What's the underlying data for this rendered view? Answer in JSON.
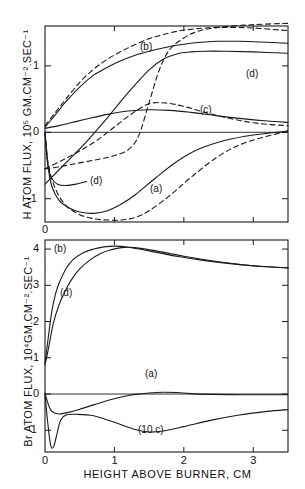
{
  "figure": {
    "panels": [
      {
        "id": "upper",
        "ylabel": "H ATOM FLUX, 10⁵ GM.CM⁻².SEC⁻¹",
        "yticks": [
          "1",
          "0",
          "-1"
        ],
        "xticks": [
          "0",
          "1",
          "2",
          "3"
        ],
        "curve_labels": [
          {
            "text": "(b)",
            "x": 140,
            "y": 41
          },
          {
            "text": "(d)",
            "x": 246,
            "y": 68
          },
          {
            "text": "(c)",
            "x": 200,
            "y": 104
          },
          {
            "text": "(d)",
            "x": 90,
            "y": 175
          },
          {
            "text": "(a)",
            "x": 150,
            "y": 183
          }
        ]
      },
      {
        "id": "lower",
        "ylabel": "Br ATOM FLUX, 10⁴GM.CM⁻².SEC⁻¹",
        "yticks": [
          "4",
          "3",
          "2",
          "1",
          "0",
          "-1"
        ],
        "xticks": [
          "0",
          "1",
          "2",
          "3"
        ],
        "curve_labels": [
          {
            "text": "(b)",
            "x": 54,
            "y": 243
          },
          {
            "text": "(d)",
            "x": 60,
            "y": 287
          },
          {
            "text": "(a)",
            "x": 145,
            "y": 368
          },
          {
            "text": "(10 c)",
            "x": 138,
            "y": 424
          }
        ]
      }
    ],
    "xlabel": "HEIGHT ABOVE BURNER, CM"
  },
  "chart_data": {
    "type": "line",
    "title": "",
    "xlabel": "HEIGHT ABOVE BURNER, CM",
    "xlim": [
      0,
      3.5
    ],
    "grid": false,
    "legend": "inline-curve-labels",
    "panels": [
      {
        "name": "H atom flux panel",
        "ylabel": "H ATOM FLUX, 10^5 GM.CM^-2.SEC^-1",
        "ylim": [
          -1.35,
          1.6
        ],
        "yticks": [
          -1,
          0,
          1
        ],
        "xticks": [
          0,
          1,
          2,
          3
        ],
        "series": [
          {
            "name": "(b) solid",
            "style": "solid",
            "x": [
              0.0,
              0.1,
              0.2,
              0.3,
              0.5,
              0.7,
              0.9,
              1.1,
              1.3,
              1.5,
              1.7,
              1.9,
              2.1,
              2.3,
              2.5,
              2.8,
              3.1,
              3.5
            ],
            "y": [
              0.08,
              0.2,
              0.33,
              0.46,
              0.68,
              0.86,
              0.98,
              1.08,
              1.16,
              1.22,
              1.27,
              1.31,
              1.34,
              1.36,
              1.37,
              1.37,
              1.36,
              1.34
            ]
          },
          {
            "name": "(b) dashed",
            "style": "dashed",
            "x": [
              0.0,
              0.15,
              0.3,
              0.5,
              0.7,
              0.9,
              1.1,
              1.3,
              1.5,
              1.7,
              1.9,
              2.1,
              2.3,
              2.6,
              3.0,
              3.5
            ],
            "y": [
              0.1,
              0.3,
              0.5,
              0.75,
              0.95,
              1.1,
              1.22,
              1.32,
              1.41,
              1.47,
              1.52,
              1.55,
              1.57,
              1.58,
              1.57,
              1.53
            ]
          },
          {
            "name": "(d) upper solid",
            "style": "solid",
            "x": [
              0.0,
              0.3,
              0.6,
              0.9,
              1.2,
              1.5,
              1.7,
              1.9,
              2.1,
              2.3,
              2.6,
              3.0,
              3.5
            ],
            "y": [
              -0.78,
              -0.46,
              -0.14,
              0.22,
              0.6,
              0.94,
              1.1,
              1.18,
              1.21,
              1.22,
              1.22,
              1.21,
              1.19
            ]
          },
          {
            "name": "(d) dashed rising",
            "style": "dashed",
            "x": [
              0.0,
              0.2,
              0.4,
              0.6,
              0.8,
              1.0,
              1.2,
              1.35,
              1.5,
              1.65,
              1.8,
              2.0,
              2.2,
              2.5,
              3.0,
              3.5
            ],
            "y": [
              -0.55,
              -0.52,
              -0.48,
              -0.44,
              -0.4,
              -0.35,
              -0.26,
              -0.05,
              0.45,
              0.95,
              1.25,
              1.42,
              1.52,
              1.58,
              1.62,
              1.64
            ]
          },
          {
            "name": "(c) solid",
            "style": "solid",
            "x": [
              0.0,
              0.2,
              0.4,
              0.6,
              0.9,
              1.2,
              1.5,
              1.8,
              2.1,
              2.4,
              2.8,
              3.2,
              3.5
            ],
            "y": [
              0.06,
              0.1,
              0.15,
              0.2,
              0.27,
              0.32,
              0.34,
              0.33,
              0.3,
              0.26,
              0.21,
              0.17,
              0.15
            ]
          },
          {
            "name": "(c) dashed",
            "style": "dashed",
            "x": [
              0.0,
              0.25,
              0.5,
              0.75,
              1.0,
              1.25,
              1.5,
              1.75,
              2.0,
              2.3,
              2.7,
              3.1,
              3.5
            ],
            "y": [
              -0.55,
              -0.42,
              -0.28,
              -0.12,
              0.08,
              0.28,
              0.43,
              0.44,
              0.39,
              0.3,
              0.2,
              0.13,
              0.1
            ]
          },
          {
            "name": "(a) solid",
            "style": "solid",
            "x": [
              0.0,
              0.05,
              0.1,
              0.2,
              0.35,
              0.5,
              0.7,
              0.9,
              1.1,
              1.3,
              1.6,
              1.9,
              2.2,
              2.6,
              3.0,
              3.5
            ],
            "y": [
              0.0,
              -0.55,
              -0.82,
              -1.02,
              -1.14,
              -1.2,
              -1.22,
              -1.18,
              -1.08,
              -0.94,
              -0.68,
              -0.44,
              -0.26,
              -0.12,
              -0.04,
              0.02
            ]
          },
          {
            "name": "(a) dashed",
            "style": "dashed",
            "x": [
              0.0,
              0.05,
              0.15,
              0.3,
              0.5,
              0.7,
              0.9,
              1.1,
              1.3,
              1.5,
              1.8,
              2.1,
              2.5,
              2.9,
              3.5
            ],
            "y": [
              0.0,
              -0.5,
              -0.85,
              -1.1,
              -1.24,
              -1.3,
              -1.32,
              -1.32,
              -1.28,
              -1.18,
              -0.95,
              -0.68,
              -0.36,
              -0.15,
              0.02
            ]
          },
          {
            "name": "steep near-origin solid",
            "style": "solid",
            "x": [
              0.0,
              0.02,
              0.05,
              0.1,
              0.18,
              0.3,
              0.45,
              0.6
            ],
            "y": [
              0.0,
              -0.3,
              -0.55,
              -0.7,
              -0.78,
              -0.8,
              -0.78,
              -0.74
            ]
          }
        ]
      },
      {
        "name": "Br atom flux panel",
        "ylabel": "Br ATOM FLUX, 10^4 GM.CM^-2.SEC^-1",
        "ylim": [
          -1.6,
          4.25
        ],
        "yticks": [
          -1,
          0,
          1,
          2,
          3,
          4
        ],
        "xticks": [
          0,
          1,
          2,
          3
        ],
        "series": [
          {
            "name": "(b)",
            "style": "solid",
            "x": [
              0.0,
              0.05,
              0.1,
              0.15,
              0.2,
              0.3,
              0.4,
              0.55,
              0.7,
              0.85,
              1.0,
              1.2,
              1.5,
              1.9,
              2.3,
              2.8,
              3.2,
              3.5
            ],
            "y": [
              0.85,
              1.6,
              2.3,
              2.75,
              3.05,
              3.45,
              3.7,
              3.9,
              4.0,
              4.06,
              4.08,
              4.05,
              3.95,
              3.8,
              3.68,
              3.57,
              3.51,
              3.48
            ]
          },
          {
            "name": "(d)",
            "style": "solid",
            "x": [
              0.0,
              0.05,
              0.12,
              0.2,
              0.28,
              0.38,
              0.5,
              0.65,
              0.8,
              0.95,
              1.1,
              1.3,
              1.6,
              2.0,
              2.5,
              3.0,
              3.5
            ],
            "y": [
              0.8,
              1.25,
              1.95,
              2.45,
              2.8,
              3.15,
              3.45,
              3.7,
              3.88,
              3.98,
              4.04,
              4.04,
              3.95,
              3.8,
              3.65,
              3.54,
              3.48
            ]
          },
          {
            "name": "(a)",
            "style": "solid",
            "x": [
              0.0,
              0.05,
              0.1,
              0.2,
              0.35,
              0.5,
              0.7,
              0.9,
              1.1,
              1.3,
              1.5,
              1.7,
              1.9,
              2.1,
              2.4,
              2.8,
              3.2,
              3.5
            ],
            "y": [
              0.02,
              -0.3,
              -0.48,
              -0.55,
              -0.5,
              -0.42,
              -0.3,
              -0.18,
              -0.08,
              -0.01,
              0.03,
              0.05,
              0.04,
              0.01,
              -0.01,
              -0.02,
              -0.02,
              -0.02
            ]
          },
          {
            "name": "(10 c)",
            "style": "solid",
            "x": [
              0.0,
              0.04,
              0.08,
              0.12,
              0.16,
              0.22,
              0.3,
              0.45,
              0.7,
              1.0,
              1.3,
              1.5,
              1.7,
              2.0,
              2.4,
              2.8,
              3.2,
              3.5
            ],
            "y": [
              0.0,
              -0.8,
              -1.4,
              -1.47,
              -1.2,
              -0.75,
              -0.58,
              -0.56,
              -0.6,
              -0.78,
              -0.98,
              -1.05,
              -1.02,
              -0.9,
              -0.72,
              -0.58,
              -0.48,
              -0.43
            ]
          }
        ]
      }
    ]
  }
}
